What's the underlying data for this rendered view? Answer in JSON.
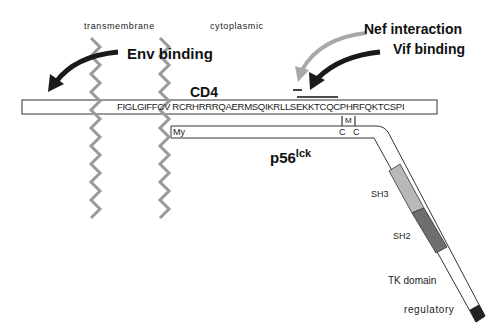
{
  "labels": {
    "transmembrane": "transmembrane",
    "cytoplasmic": "cytoplasmic",
    "env_binding": "Env binding",
    "nef_interaction": "Nef interaction",
    "vif_binding": "Vif binding",
    "cd4": "CD4",
    "cd4_sequence": "FIGLGIFFCV RCRHRRRQAERMSQIKRLLSEKKTCQCPHRFQKTCSPI",
    "my": "My",
    "m": "M",
    "c1": "C",
    "c2": "C",
    "p56": "p56",
    "lck": "lck",
    "sh3": "SH3",
    "sh2": "SH2",
    "tk_domain": "TK domain",
    "regulatory": "regulatory"
  },
  "colors": {
    "helix": "#9a9a9a",
    "arrow_dark": "#1a1a1a",
    "arrow_light": "#a8a8a8",
    "sh3": "#b8b8b8",
    "sh2": "#6e6e6e",
    "regulatory": "#222222",
    "outline": "#333333"
  }
}
